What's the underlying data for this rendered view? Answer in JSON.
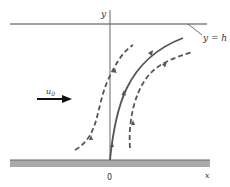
{
  "diagram": {
    "type": "flow-streamlines",
    "labels": {
      "y_axis": "y",
      "x_axis": "x",
      "origin": "0",
      "top_boundary": "y = h",
      "velocity": "u",
      "velocity_sub": "0"
    },
    "colors": {
      "line": "#555555",
      "axis": "#666666",
      "wall_fill": "#aaaaaa",
      "wall_edge": "#666666",
      "arrow": "#111111"
    },
    "elements": [
      "top boundary line at y = h",
      "vertical y-axis through origin",
      "shaded wall along x-axis",
      "uniform flow arrow labelled u0",
      "solid streamline from origin curving right",
      "two dashed streamlines either side"
    ]
  }
}
